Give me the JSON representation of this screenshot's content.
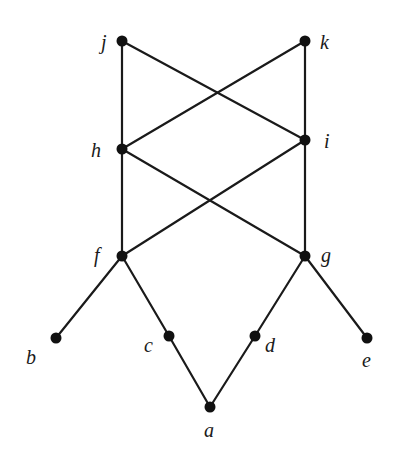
{
  "diagram": {
    "type": "hasse-diagram",
    "colors": {
      "line": "#1a1a1a",
      "node": "#111111",
      "background": "#ffffff"
    },
    "nodes": [
      {
        "id": "j",
        "label": "j",
        "x": 122,
        "y": 41,
        "lx": 101,
        "ly": 49
      },
      {
        "id": "k",
        "label": "k",
        "x": 305,
        "y": 41,
        "lx": 320,
        "ly": 49
      },
      {
        "id": "h",
        "label": "h",
        "x": 122,
        "y": 149,
        "lx": 91,
        "ly": 157
      },
      {
        "id": "i",
        "label": "i",
        "x": 305,
        "y": 140,
        "lx": 324,
        "ly": 148
      },
      {
        "id": "f",
        "label": "f",
        "x": 122,
        "y": 256,
        "lx": 94,
        "ly": 262
      },
      {
        "id": "g",
        "label": "g",
        "x": 305,
        "y": 256,
        "lx": 321,
        "ly": 262
      },
      {
        "id": "b",
        "label": "b",
        "x": 56,
        "y": 338,
        "lx": 26,
        "ly": 364
      },
      {
        "id": "c",
        "label": "c",
        "x": 169,
        "y": 336,
        "lx": 144,
        "ly": 352
      },
      {
        "id": "d",
        "label": "d",
        "x": 255,
        "y": 336,
        "lx": 265,
        "ly": 352
      },
      {
        "id": "e",
        "label": "e",
        "x": 367,
        "y": 338,
        "lx": 362,
        "ly": 367
      },
      {
        "id": "a",
        "label": "a",
        "x": 210,
        "y": 407,
        "lx": 204,
        "ly": 437
      }
    ],
    "edges": [
      [
        "j",
        "h"
      ],
      [
        "j",
        "i"
      ],
      [
        "k",
        "h"
      ],
      [
        "k",
        "i"
      ],
      [
        "h",
        "f"
      ],
      [
        "h",
        "g"
      ],
      [
        "i",
        "f"
      ],
      [
        "i",
        "g"
      ],
      [
        "f",
        "b"
      ],
      [
        "f",
        "c"
      ],
      [
        "g",
        "d"
      ],
      [
        "g",
        "e"
      ],
      [
        "c",
        "a"
      ],
      [
        "d",
        "a"
      ]
    ]
  }
}
